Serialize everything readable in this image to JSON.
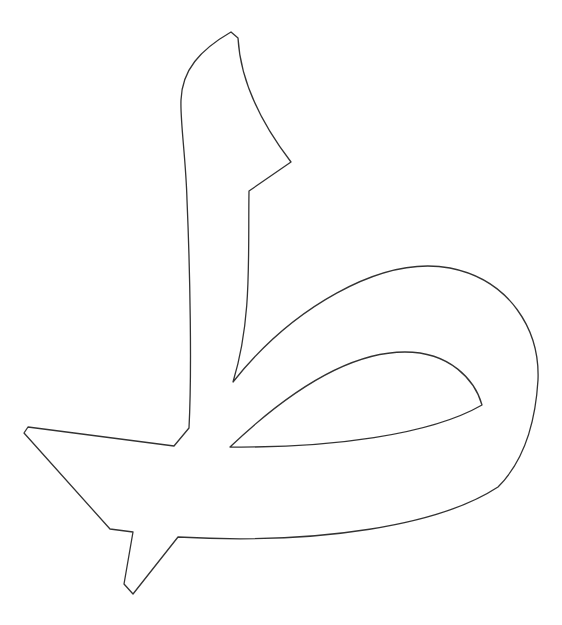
{
  "figure": {
    "glyph": "ط",
    "stroke_color": "#333333",
    "fill_color": "#ffffff",
    "background_color": "#ffffff"
  }
}
